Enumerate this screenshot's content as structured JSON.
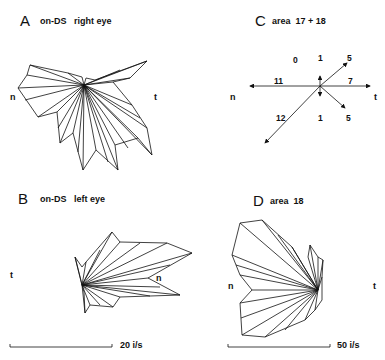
{
  "panels": {
    "A": {
      "letter": "A",
      "title": "on-DS   right eye",
      "left_label": "n",
      "right_label": "t"
    },
    "B": {
      "letter": "B",
      "title": "on-DS   left eye",
      "left_label": "t",
      "inner_label": "n",
      "scale": "20 i/s"
    },
    "C": {
      "letter": "C",
      "title": "area  17 + 18",
      "left_label": "n",
      "right_label": "t",
      "counts": {
        "up_left": "0",
        "up": "1",
        "up_right": "5",
        "left": "11",
        "right": "7",
        "down_left": "12",
        "down": "1",
        "down_right": "5"
      }
    },
    "D": {
      "letter": "D",
      "title": "area  18",
      "left_label": "n",
      "right_label": "t",
      "scale": "50 i/s"
    }
  },
  "colors": {
    "line": "#111111",
    "background": "#ffffff"
  }
}
